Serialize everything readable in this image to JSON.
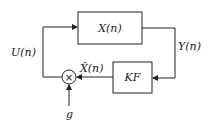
{
  "diagram": {
    "type": "block-diagram",
    "blocks": [
      {
        "id": "plant",
        "label": "X(n)"
      },
      {
        "id": "kalman_filter",
        "label": "KF"
      }
    ],
    "junctions": [
      {
        "id": "multiplier",
        "symbol": "×"
      }
    ],
    "signals": [
      {
        "id": "output",
        "label": "Y(n)",
        "from": "plant",
        "to": "kalman_filter"
      },
      {
        "id": "estimate",
        "label": "X̂(n)",
        "from": "kalman_filter",
        "to": "multiplier"
      },
      {
        "id": "gain",
        "label": "g",
        "from": "external",
        "to": "multiplier"
      },
      {
        "id": "control",
        "label": "U(n)",
        "from": "multiplier",
        "to": "plant"
      }
    ]
  },
  "labels": {
    "plant": "X(n)",
    "kf": "KF",
    "y": "Y(n)",
    "xhat": "X̂(n)",
    "u": "U(n)",
    "g": "g",
    "multiply": "×"
  },
  "colors": {
    "line": "#222222",
    "box_fill": "#ffffff"
  }
}
